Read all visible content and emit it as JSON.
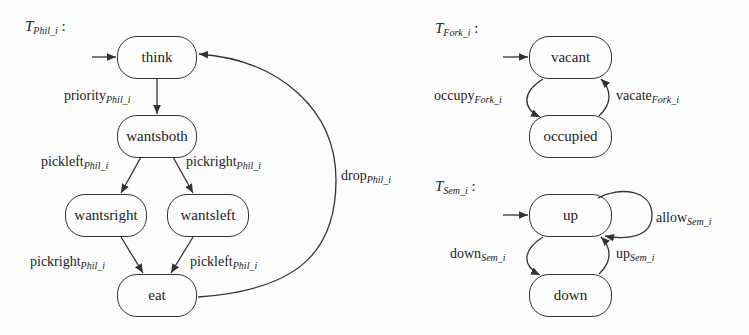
{
  "diagrams": {
    "phil": {
      "title": "T",
      "title_sub": "Phil_i",
      "states": [
        "think",
        "wantsboth",
        "wantsright",
        "wantsleft",
        "eat"
      ],
      "initial": "think",
      "transitions": [
        {
          "from": "think",
          "to": "wantsboth",
          "label": "priority",
          "sub": "Phil_i"
        },
        {
          "from": "wantsboth",
          "to": "wantsright",
          "label": "pickleft",
          "sub": "Phil_i"
        },
        {
          "from": "wantsboth",
          "to": "wantsleft",
          "label": "pickright",
          "sub": "Phil_i"
        },
        {
          "from": "wantsright",
          "to": "eat",
          "label": "pickright",
          "sub": "Phil_i"
        },
        {
          "from": "wantsleft",
          "to": "eat",
          "label": "pickleft",
          "sub": "Phil_i"
        },
        {
          "from": "eat",
          "to": "think",
          "label": "drop",
          "sub": "Phil_i"
        }
      ]
    },
    "fork": {
      "title": "T",
      "title_sub": "Fork_i",
      "states": [
        "vacant",
        "occupied"
      ],
      "initial": "vacant",
      "transitions": [
        {
          "from": "vacant",
          "to": "occupied",
          "label": "occupy",
          "sub": "Fork_i"
        },
        {
          "from": "occupied",
          "to": "vacant",
          "label": "vacate",
          "sub": "Fork_i"
        }
      ]
    },
    "sem": {
      "title": "T",
      "title_sub": "Sem_i",
      "states": [
        "up",
        "down"
      ],
      "initial": "up",
      "transitions": [
        {
          "from": "up",
          "to": "up",
          "label": "allow",
          "sub": "Sem_i"
        },
        {
          "from": "up",
          "to": "down",
          "label": "down",
          "sub": "Sem_i"
        },
        {
          "from": "down",
          "to": "up",
          "label": "up",
          "sub": "Sem_i"
        }
      ]
    }
  },
  "colon": ":"
}
